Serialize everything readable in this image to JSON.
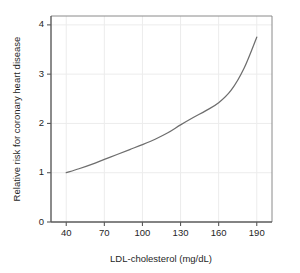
{
  "chart_data": {
    "type": "line",
    "title": "",
    "subtitle": "",
    "xlabel": "LDL-cholesterol (mg/dL)",
    "ylabel": "Relative risk for coronary heart disease",
    "xlim": [
      28,
      202
    ],
    "ylim": [
      0,
      4.18
    ],
    "xticks": [
      40,
      70,
      100,
      130,
      160,
      190
    ],
    "xticklabels": [
      "40",
      "70",
      "100",
      "130",
      "160",
      "190"
    ],
    "yticks": [
      0,
      1,
      2,
      3,
      4
    ],
    "yticklabels": [
      "0",
      "1",
      "2",
      "3",
      "4"
    ],
    "grid": true,
    "grid_axis": "both",
    "legend": false,
    "legend_position": "none",
    "series": [
      {
        "name": "Relative risk",
        "color": "#6e6e6e",
        "x": [
          40,
          50,
          60,
          70,
          80,
          90,
          100,
          110,
          120,
          130,
          140,
          150,
          160,
          170,
          180,
          190
        ],
        "y": [
          1.0,
          1.08,
          1.17,
          1.27,
          1.37,
          1.47,
          1.57,
          1.68,
          1.81,
          1.97,
          2.12,
          2.26,
          2.42,
          2.68,
          3.12,
          3.75
        ]
      }
    ],
    "annotations": []
  },
  "axes": {
    "y_title": "Relative risk for coronary heart disease",
    "x_title": "LDL-cholesterol (mg/dL)"
  },
  "colors": {
    "curve": "#6e6e6e",
    "axis": "#5a5a5a",
    "grid": "#ececec",
    "background": "#ffffff",
    "text": "#262626"
  }
}
